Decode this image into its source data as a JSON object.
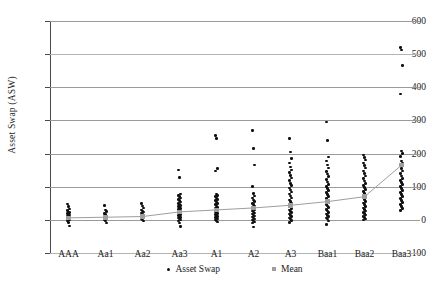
{
  "chart_data": {
    "type": "scatter",
    "title": "",
    "xlabel": "",
    "ylabel": "Asset Swap (ASW)",
    "ylim": [
      -100,
      600
    ],
    "yticks": [
      -100,
      0,
      100,
      200,
      300,
      400,
      500,
      600
    ],
    "grid": true,
    "legend_position": "bottom",
    "categories": [
      "AAA",
      "Aa1",
      "Aa2",
      "Aa3",
      "A1",
      "A2",
      "A3",
      "Baa1",
      "Baa2",
      "Baa3"
    ],
    "series": [
      {
        "name": "Asset Swap",
        "type": "scatter",
        "color": "#111111",
        "points": {
          "AAA": [
            48,
            40,
            33,
            28,
            24,
            22,
            20,
            18,
            15,
            12,
            10,
            8,
            5,
            2,
            0,
            -3,
            -8,
            -18
          ],
          "Aa1": [
            44,
            30,
            25,
            20,
            16,
            12,
            9,
            6,
            3,
            0,
            -4,
            -10
          ],
          "Aa2": [
            50,
            42,
            36,
            30,
            27,
            24,
            21,
            18,
            15,
            12,
            9,
            6,
            3,
            0,
            -3
          ],
          "Aa3": [
            150,
            128,
            78,
            74,
            70,
            66,
            62,
            58,
            54,
            50,
            47,
            44,
            41,
            38,
            35,
            32,
            29,
            26,
            23,
            20,
            17,
            14,
            11,
            8,
            5,
            2,
            0,
            -4,
            -10,
            -20
          ],
          "A1": [
            255,
            245,
            155,
            148,
            78,
            74,
            70,
            66,
            62,
            58,
            54,
            50,
            46,
            42,
            38,
            35,
            32,
            29,
            26,
            23,
            20,
            17,
            14,
            11,
            8,
            5,
            2,
            0,
            -3,
            -6
          ],
          "A2": [
            270,
            215,
            165,
            100,
            80,
            72,
            66,
            60,
            55,
            50,
            46,
            42,
            38,
            34,
            30,
            27,
            24,
            21,
            18,
            15,
            12,
            9,
            6,
            3,
            0,
            -3,
            -6,
            -10,
            -22
          ],
          "A3": [
            245,
            205,
            185,
            172,
            160,
            150,
            142,
            134,
            126,
            118,
            110,
            103,
            96,
            90,
            84,
            78,
            72,
            66,
            60,
            55,
            50,
            45,
            40,
            35,
            30,
            26,
            22,
            18,
            14,
            10,
            6,
            2,
            -2,
            -8
          ],
          "Baa1": [
            295,
            240,
            190,
            178,
            166,
            156,
            146,
            138,
            130,
            122,
            114,
            107,
            100,
            94,
            88,
            82,
            76,
            70,
            64,
            58,
            52,
            47,
            42,
            37,
            32,
            27,
            22,
            18,
            14,
            10,
            6,
            2,
            -4,
            -14
          ],
          "Baa2": [
            196,
            188,
            180,
            172,
            164,
            156,
            148,
            140,
            132,
            124,
            117,
            110,
            103,
            97,
            91,
            85,
            79,
            73,
            67,
            61,
            56,
            51,
            46,
            41,
            36,
            31,
            27,
            23,
            19,
            15,
            11,
            7,
            3,
            0
          ],
          "Baa3": [
            520,
            512,
            465,
            380,
            208,
            200,
            192,
            178,
            170,
            162,
            155,
            148,
            140,
            132,
            124,
            118,
            112,
            106,
            100,
            94,
            88,
            82,
            76,
            70,
            64,
            58,
            52,
            46,
            40,
            34,
            28
          ]
        }
      },
      {
        "name": "Mean",
        "type": "line",
        "color": "#9e9e9e",
        "values": [
          6,
          8,
          10,
          24,
          30,
          36,
          44,
          55,
          70,
          165
        ]
      }
    ]
  },
  "legend": {
    "items": [
      {
        "label": "Asset Swap",
        "marker": "dot-icon",
        "color": "#111111"
      },
      {
        "label": "Mean",
        "marker": "square-icon",
        "color": "#9e9e9e"
      }
    ]
  }
}
